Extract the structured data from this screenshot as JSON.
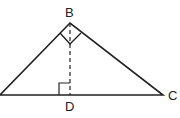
{
  "diagram": {
    "type": "geometry-triangle",
    "vertices": {
      "A": {
        "label": "",
        "x": 0,
        "y": 95
      },
      "B": {
        "label": "B",
        "x": 70,
        "y": 23
      },
      "C": {
        "label": "C",
        "x": 163,
        "y": 95
      },
      "D": {
        "label": "D",
        "x": 70,
        "y": 95
      }
    },
    "segments": [
      {
        "from": "A",
        "to": "B",
        "style": "solid"
      },
      {
        "from": "B",
        "to": "C",
        "style": "solid"
      },
      {
        "from": "A",
        "to": "C",
        "style": "solid"
      },
      {
        "from": "B",
        "to": "D",
        "style": "dashed"
      }
    ],
    "right_angle_marks": [
      "B",
      "D"
    ],
    "colors": {
      "stroke": "#222222",
      "background": "#ffffff"
    }
  }
}
